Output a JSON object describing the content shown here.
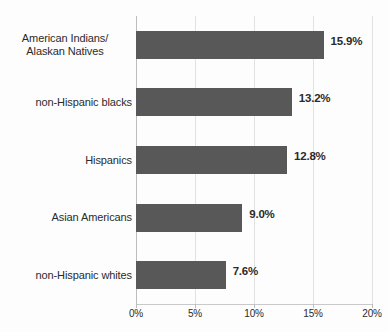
{
  "chart_data": {
    "type": "bar",
    "orientation": "horizontal",
    "title": "",
    "xlabel": "",
    "ylabel": "",
    "xlim": [
      0,
      20
    ],
    "xtick_labels": [
      "0%",
      "5%",
      "10%",
      "15%",
      "20%"
    ],
    "xticks": [
      0,
      5,
      10,
      15,
      20
    ],
    "grid": true,
    "legend": "none",
    "bar_color": "#585858",
    "categories": [
      "American Indians/\nAlaskan Natives",
      "non-Hispanic blacks",
      "Hispanics",
      "Asian Americans",
      "non-Hispanic whites"
    ],
    "values": [
      15.9,
      13.2,
      12.8,
      9.0,
      7.6
    ],
    "value_labels": [
      "15.9%",
      "13.2%",
      "12.8%",
      "9.0%",
      "7.6%"
    ],
    "bars": [
      {
        "label_line1": "American Indians/",
        "label_line2": "Alaskan Natives",
        "value": 15.9,
        "value_label": "15.9%"
      },
      {
        "label_line1": "non-Hispanic blacks",
        "label_line2": "",
        "value": 13.2,
        "value_label": "13.2%"
      },
      {
        "label_line1": "Hispanics",
        "label_line2": "",
        "value": 12.8,
        "value_label": "12.8%"
      },
      {
        "label_line1": "Asian Americans",
        "label_line2": "",
        "value": 9.0,
        "value_label": "9.0%"
      },
      {
        "label_line1": "non-Hispanic whites",
        "label_line2": "",
        "value": 7.6,
        "value_label": "7.6%"
      }
    ]
  },
  "cut_off_title": "​"
}
